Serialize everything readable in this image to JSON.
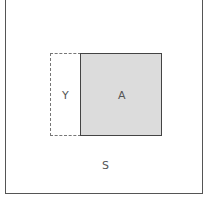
{
  "diagram": {
    "labels": {
      "y": "Y",
      "a": "A",
      "s": "S"
    },
    "colors": {
      "a_fill": "#dcdcdc",
      "border": "#444444"
    }
  }
}
